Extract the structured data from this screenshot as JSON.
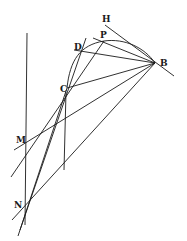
{
  "diagram": {
    "type": "geometric-construction",
    "labels": {
      "H": "H",
      "P": "P",
      "D": "D",
      "B": "B",
      "C": "C",
      "M": "M",
      "N": "N"
    },
    "points": {
      "H": [
        105,
        25
      ],
      "P": [
        104,
        41
      ],
      "D": [
        80,
        51
      ],
      "B": [
        155,
        63
      ],
      "C": [
        67,
        88
      ],
      "M": [
        26,
        145
      ],
      "N": [
        25,
        207
      ]
    },
    "colors": {
      "ink": "#1a1a1a",
      "background": "#ffffff"
    }
  }
}
